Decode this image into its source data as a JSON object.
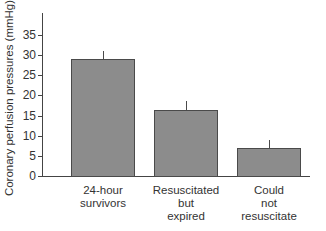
{
  "chart_data": {
    "type": "bar",
    "title": "",
    "xlabel": "",
    "ylabel": "Coronary perfusion pressures (mmHg)",
    "ylim": [
      0,
      40
    ],
    "yticks": [
      0,
      5,
      10,
      15,
      20,
      25,
      30,
      35
    ],
    "grid": false,
    "legend": null,
    "categories": [
      "24-hour survivors",
      "Resuscitated but expired",
      "Could not resuscitate"
    ],
    "category_label_lines": [
      [
        "24-hour",
        "survivors"
      ],
      [
        "Resuscitated",
        "but",
        "expired"
      ],
      [
        "Could",
        "not",
        "resuscitate"
      ]
    ],
    "values": [
      29,
      16.5,
      7
    ],
    "error_upper": [
      31,
      18.5,
      9
    ],
    "colors": {
      "bar_fill": "#8c8c8c",
      "bar_edge": "#4a4a4a",
      "axis": "#444444"
    }
  }
}
